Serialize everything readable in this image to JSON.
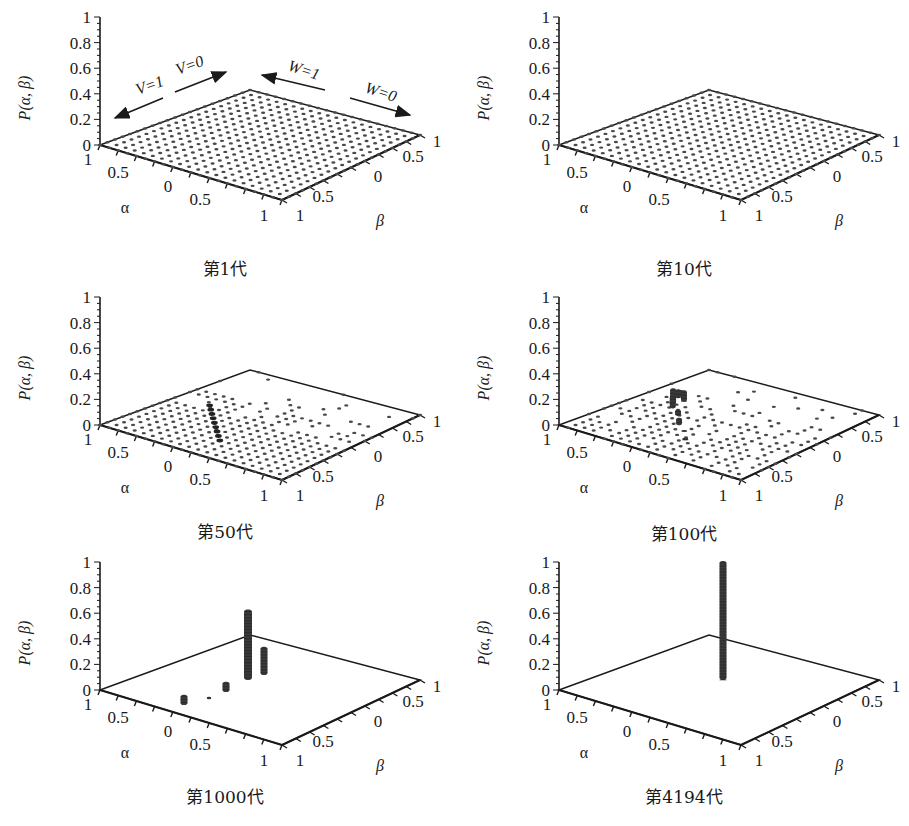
{
  "figure": {
    "z_axis_label": "P(α, β)",
    "alpha_label": "α",
    "beta_label": "β",
    "z_ticks": [
      "0",
      "0.2",
      "0.4",
      "0.6",
      "0.8",
      "1"
    ],
    "alpha_ticks": [
      "1",
      "0.5",
      "0",
      "0.5",
      "1"
    ],
    "beta_ticks": [
      "1",
      "0.5",
      "0",
      "0.5",
      "1"
    ],
    "annotations": {
      "v1": "V=1",
      "v0": "V=0",
      "w1": "W=1",
      "w0": "W=0"
    }
  },
  "chart_data": [
    {
      "type": "bar3d",
      "title": "第1代",
      "generation": 1,
      "xlabel": "α",
      "ylabel": "β",
      "zlabel": "P(α, β)",
      "zlim": [
        0,
        1
      ],
      "description": "Uniform distribution: every grid cell has a tiny, near-zero probability (full dotted grid covering the whole α-β plane).",
      "grid_size": 21,
      "annotations": [
        "V=1",
        "V=0",
        "W=1",
        "W=0"
      ]
    },
    {
      "type": "bar3d",
      "title": "第10代",
      "generation": 10,
      "xlabel": "α",
      "ylabel": "β",
      "zlabel": "P(α, β)",
      "zlim": [
        0,
        1
      ],
      "description": "Still nearly uniform: full dotted grid, all heights near 0.",
      "grid_size": 21
    },
    {
      "type": "bar3d",
      "title": "第50代",
      "generation": 50,
      "xlabel": "α",
      "ylabel": "β",
      "zlabel": "P(α, β)",
      "zlim": [
        0,
        1
      ],
      "description": "Grid thinning toward the front-right (β→1 side emptying); slightly darker cells along a diagonal ridge; heights still ≈0.02 or less."
    },
    {
      "type": "bar3d",
      "title": "第100代",
      "generation": 100,
      "xlabel": "α",
      "ylabel": "β",
      "zlabel": "P(α, β)",
      "zlim": [
        0,
        1
      ],
      "description": "Sparse grid; small columns (≈0.05–0.1) clustering along the diagonal ridge near the center-back.",
      "peaks": [
        {
          "label": "central cluster",
          "height": 0.1
        },
        {
          "label": "mid ridge",
          "height": 0.05
        },
        {
          "label": "front ridge",
          "height": 0.03
        }
      ]
    },
    {
      "type": "bar3d",
      "title": "第1000代",
      "generation": 1000,
      "xlabel": "α",
      "ylabel": "β",
      "zlabel": "P(α, β)",
      "zlim": [
        0,
        1
      ],
      "description": "Probability concentrated in a few columns along the diagonal.",
      "peaks": [
        {
          "label": "tallest column",
          "height": 0.55
        },
        {
          "label": "second column",
          "height": 0.22
        },
        {
          "label": "third column",
          "height": 0.08
        },
        {
          "label": "front column",
          "height": 0.08
        },
        {
          "label": "small dot",
          "height": 0.01
        }
      ]
    },
    {
      "type": "bar3d",
      "title": "第4194代",
      "generation": 4194,
      "xlabel": "α",
      "ylabel": "β",
      "zlabel": "P(α, β)",
      "zlim": [
        0,
        1
      ],
      "description": "Converged: a single column at the center with P ≈ 1.",
      "peaks": [
        {
          "label": "single column",
          "height": 1.0
        }
      ]
    }
  ],
  "captions": [
    "第1代",
    "第10代",
    "第50代",
    "第100代",
    "第1000代",
    "第4194代"
  ]
}
